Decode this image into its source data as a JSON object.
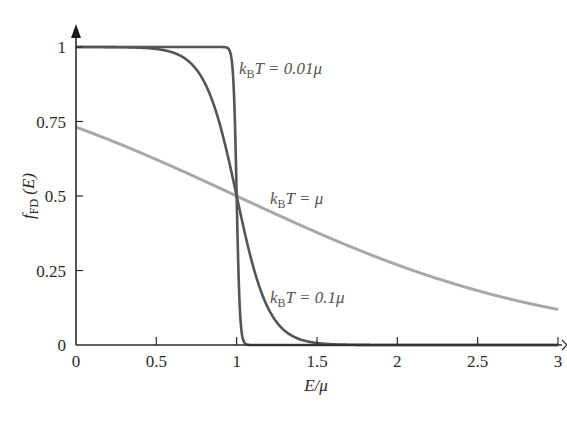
{
  "chart_data": {
    "type": "line",
    "title": "",
    "xlabel": "E/μ",
    "ylabel": "f_FD (E)",
    "xlim": [
      0,
      3
    ],
    "ylim": [
      0,
      1
    ],
    "grid": false,
    "legend": "inline annotations",
    "x_ticks": [
      0,
      0.5,
      1,
      1.5,
      2,
      2.5,
      3
    ],
    "x_tick_labels": [
      "0",
      "0.5",
      "1",
      "1.5",
      "2",
      "2.5",
      "3"
    ],
    "y_ticks": [
      0,
      0.25,
      0.5,
      0.75,
      1
    ],
    "y_tick_labels": [
      "0",
      "0.25",
      "0.5",
      "0.75",
      "1"
    ],
    "function": "f_FD(E) = 1 / (exp((E - μ)/(k_B T)) + 1)",
    "series": [
      {
        "name": "k_B T = 0.01μ",
        "kT": 0.01,
        "color": "#555555",
        "x": [
          0,
          0.5,
          0.9,
          0.95,
          0.98,
          1.0,
          1.02,
          1.05,
          1.1,
          1.5,
          2,
          3
        ],
        "values": [
          1.0,
          1.0,
          1.0,
          0.993,
          0.881,
          0.5,
          0.119,
          0.007,
          0.0,
          0.0,
          0.0,
          0.0
        ]
      },
      {
        "name": "k_B T = 0.1μ",
        "kT": 0.1,
        "color": "#555555",
        "x": [
          0,
          0.5,
          0.7,
          0.8,
          0.9,
          1.0,
          1.1,
          1.2,
          1.3,
          1.5,
          2,
          3
        ],
        "values": [
          1.0,
          0.982,
          0.953,
          0.881,
          0.731,
          0.5,
          0.269,
          0.119,
          0.047,
          0.007,
          0.0,
          0.0
        ]
      },
      {
        "name": "k_B T = μ",
        "kT": 1.0,
        "color": "#a8a8a8",
        "x": [
          0,
          0.5,
          1,
          1.5,
          2,
          2.5,
          3
        ],
        "values": [
          0.731,
          0.622,
          0.5,
          0.378,
          0.269,
          0.182,
          0.119
        ]
      }
    ],
    "annotations": [
      {
        "text_prefix": "k",
        "text_sub": "B",
        "text_suffix": "T = 0.01μ",
        "x": 1.02,
        "y": 0.93
      },
      {
        "text_prefix": "k",
        "text_sub": "B",
        "text_suffix": "T = μ",
        "x": 1.22,
        "y": 0.49
      },
      {
        "text_prefix": "k",
        "text_sub": "B",
        "text_suffix": "T = 0.1μ",
        "x": 1.22,
        "y": 0.14
      }
    ]
  },
  "labels": {
    "ylabel_main": "f",
    "ylabel_sub": "FD",
    "ylabel_arg": " (E)",
    "xlabel_main": "E/μ",
    "ann_k": "k",
    "ann_B": "B",
    "ann1_rest": "T = 0.01μ",
    "ann2_rest": "T = μ",
    "ann3_rest": "T = 0.1μ"
  }
}
